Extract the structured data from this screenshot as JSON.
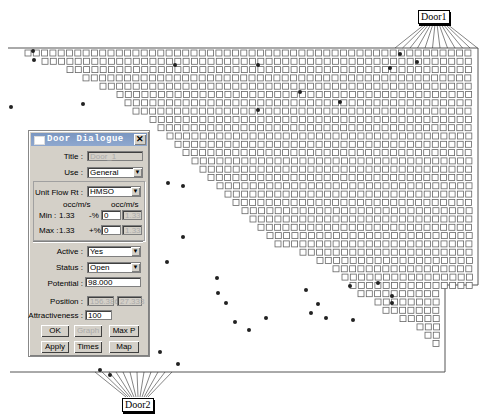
{
  "doors": {
    "door1": {
      "label": "Door1"
    },
    "door2": {
      "label": "Door2"
    }
  },
  "dialog": {
    "title": "Door Dialogue",
    "close_icon": "close-icon",
    "title_label": "Title :",
    "title_value": "Door_1",
    "use_label": "Use :",
    "use_value": "General",
    "unit_flow_label": "Unit Flow Rt :",
    "unit_flow_value": "HMSO",
    "unit_header_left": "occ/m/s",
    "unit_header_right": "occ/m/s",
    "min_label": "Min :",
    "min_value": "1.33",
    "min_pct_label": "-%",
    "min_pct_value": "0",
    "min_result": "1.33",
    "max_label": "Max :",
    "max_value": "1.33",
    "max_pct_label": "+%",
    "max_pct_value": "0",
    "max_result": "1.33",
    "active_label": "Active :",
    "active_value": "Yes",
    "status_label": "Status :",
    "status_value": "Open",
    "potential_label": "Potential :",
    "potential_value": "98.000",
    "position_label": "Position :",
    "position_x": "156.386",
    "position_y": "27.333",
    "attractiveness_label": "Attractiveness :",
    "attractiveness_value": "100",
    "buttons": {
      "ok": "OK",
      "graph": "Graph",
      "maxp": "Max P",
      "apply": "Apply",
      "times": "Times",
      "map": "Map"
    }
  }
}
